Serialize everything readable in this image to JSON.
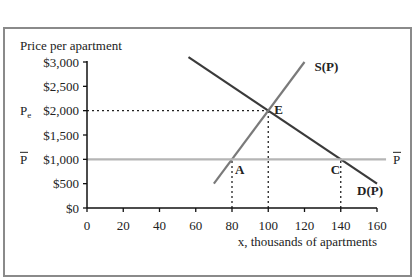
{
  "chart_data": {
    "type": "line",
    "title": "",
    "ylabel": "Price per apartment",
    "xlabel": "x, thousands of apartments",
    "xlim": [
      0,
      160
    ],
    "ylim": [
      0,
      3000
    ],
    "x_ticks": [
      0,
      20,
      40,
      60,
      80,
      100,
      120,
      140,
      160
    ],
    "x_tick_labels": [
      "0",
      "20",
      "40",
      "60",
      "80",
      "100",
      "120",
      "140",
      "160"
    ],
    "y_ticks": [
      0,
      500,
      1000,
      1500,
      2000,
      2500,
      3000
    ],
    "y_tick_labels": [
      "$0",
      "$500",
      "$1,000",
      "$1,500",
      "$2,000",
      "$2,500",
      "$3,000"
    ],
    "grid": false,
    "series": [
      {
        "name": "D(P)",
        "label": "D(P)",
        "color": "#3a3a3a",
        "x": [
          56,
          160
        ],
        "y": [
          3100,
          500
        ]
      },
      {
        "name": "S(P)",
        "label": "S(P)",
        "color": "#7a7a7a",
        "x": [
          70,
          120
        ],
        "y": [
          500,
          3000
        ]
      },
      {
        "name": "Price ceiling",
        "label": "P̄",
        "color": "#b5b5b5",
        "x": [
          0,
          165
        ],
        "y": [
          1000,
          1000
        ]
      }
    ],
    "points": [
      {
        "label": "E",
        "x": 100,
        "y": 2000
      },
      {
        "label": "A",
        "x": 80,
        "y": 1000
      },
      {
        "label": "C",
        "x": 140,
        "y": 1000
      }
    ],
    "reference_lines": [
      {
        "type": "horizontal-dotted",
        "from_x": 0,
        "to_x": 100,
        "y": 2000
      },
      {
        "type": "vertical-dotted",
        "x": 80,
        "from_y": 0,
        "to_y": 1000
      },
      {
        "type": "vertical-dotted",
        "x": 100,
        "from_y": 0,
        "to_y": 2000
      },
      {
        "type": "vertical-dotted",
        "x": 140,
        "from_y": 0,
        "to_y": 1000
      }
    ],
    "annotations": [
      {
        "text": "Pe",
        "meaning": "equilibrium price",
        "at_y": 2000
      },
      {
        "text": "P̄",
        "meaning": "price ceiling (left)",
        "at_y": 1000
      },
      {
        "text": "P̄",
        "meaning": "price ceiling (right)",
        "at_y": 1000
      }
    ]
  }
}
